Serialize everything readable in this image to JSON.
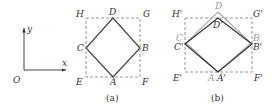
{
  "axes": {
    "origin_label": "O",
    "x_label": "x",
    "y_label": "y"
  },
  "figure_a": {
    "caption": "(a)",
    "labels": {
      "H": "H",
      "D": "D",
      "G": "G",
      "C": "C",
      "B": "B",
      "E": "E",
      "A": "A",
      "F": "F"
    }
  },
  "figure_b": {
    "caption": "(b)",
    "labels": {
      "H_prime": "H'",
      "D": "D",
      "D_prime": "D'",
      "G_prime": "G'",
      "C": "C",
      "C_prime": "C'",
      "B": "B",
      "B_prime": "B'",
      "E_prime": "E'",
      "A": "A",
      "A_prime": "A'",
      "F_prime": "F'"
    }
  },
  "colors": {
    "ink": "#333333",
    "gray_shape": "#9a9a9a",
    "dashed": "#888888"
  }
}
